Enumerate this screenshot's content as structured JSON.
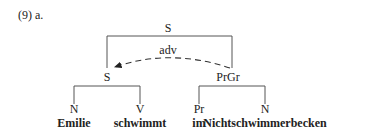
{
  "example_label": "(9)  a.",
  "tree": {
    "root": "S",
    "relation": "adv",
    "left_node": "S",
    "right_node": "PrGr",
    "left_children": [
      {
        "category": "N",
        "word": "Emilie"
      },
      {
        "category": "V",
        "word": "schwimmt"
      }
    ],
    "right_children": [
      {
        "category": "Pr",
        "word": "im"
      },
      {
        "category": "N",
        "word": "Nichtschwimmerbecken"
      }
    ]
  },
  "colors": {
    "lines": "#555555",
    "text": "#222222"
  }
}
